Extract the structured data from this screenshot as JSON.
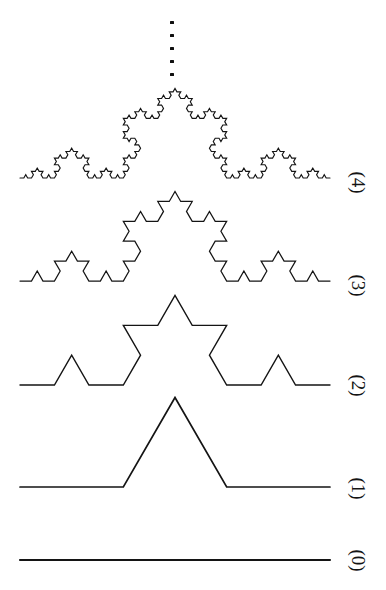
{
  "figure": {
    "type": "koch-curve-iteration-diagram",
    "background_color": "#ffffff",
    "stroke_color": "#141414",
    "width": 386,
    "height": 590,
    "curve_start_x": 20,
    "curve_end_x": 330,
    "label_x": 338,
    "continuation_marker": {
      "name": "vertical-ellipsis",
      "dot_count": 5,
      "x": 172,
      "y_start": 21,
      "y_spacing": 13,
      "dot_size": 3.2
    },
    "stages": [
      {
        "label": "(0)",
        "iteration": 0,
        "baseline_y": 560,
        "label_y": 560,
        "stroke_width": 2.1,
        "segments": 1,
        "description": "initiator: single straight segment"
      },
      {
        "label": "(1)",
        "iteration": 1,
        "baseline_y": 487,
        "label_y": 488,
        "stroke_width": 1.7,
        "segments": 4,
        "description": "generator: middle third replaced by two sides of an equilateral triangle"
      },
      {
        "label": "(2)",
        "iteration": 2,
        "baseline_y": 385,
        "label_y": 385,
        "stroke_width": 1.4,
        "segments": 16,
        "description": "second stage"
      },
      {
        "label": "(3)",
        "iteration": 3,
        "baseline_y": 281,
        "label_y": 285,
        "stroke_width": 1.25,
        "segments": 64,
        "description": "third stage"
      },
      {
        "label": "(4)",
        "iteration": 4,
        "baseline_y": 178,
        "label_y": 182,
        "stroke_width": 1.15,
        "segments": 256,
        "description": "fourth stage"
      }
    ]
  },
  "chart_data": {
    "type": "line",
    "xlabel": "",
    "ylabel": "",
    "categories": [
      "(0)",
      "(1)",
      "(2)",
      "(3)",
      "(4)"
    ],
    "series": [
      {
        "name": "segment count",
        "values": [
          1,
          4,
          16,
          64,
          256
        ]
      },
      {
        "name": "segment length (fraction of initiator)",
        "values": [
          1,
          0.3333,
          0.1111,
          0.037,
          0.0123
        ]
      },
      {
        "name": "total curve length (fraction of initiator)",
        "values": [
          1,
          1.3333,
          1.7778,
          2.3704,
          3.1605
        ]
      }
    ],
    "annotations": [
      "vertical ellipsis above stage (4) indicating continuation to the limit"
    ],
    "legend_position": "right",
    "grid": false
  }
}
